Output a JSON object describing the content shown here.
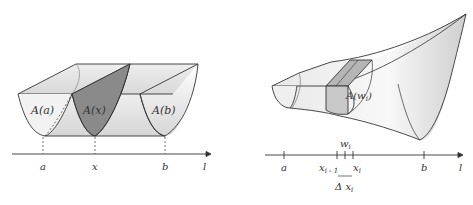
{
  "left_figure": {
    "labels": {
      "area_a": "A(a)",
      "area_x": "A(x)",
      "area_b": "A(b)"
    },
    "axis": {
      "ticks": [
        "a",
        "x",
        "b"
      ],
      "axis_label": "l"
    }
  },
  "right_figure": {
    "labels": {
      "area_w": "A(w",
      "area_w_sub": "i",
      "area_w_close": ")"
    },
    "axis": {
      "tick_a": "a",
      "tick_x_prev": "x",
      "tick_x_prev_sub": "i - 1",
      "tick_w": "w",
      "tick_w_sub": "i",
      "tick_x": "x",
      "tick_x_sub": "i",
      "tick_b": "b",
      "axis_label": "l",
      "delta": "Δ x",
      "delta_sub": "i"
    }
  },
  "colors": {
    "line": "#333333",
    "shaded": "#8a8a8a",
    "surface_light": "#f4f4f4",
    "surface_mid": "#dcdcdc"
  }
}
